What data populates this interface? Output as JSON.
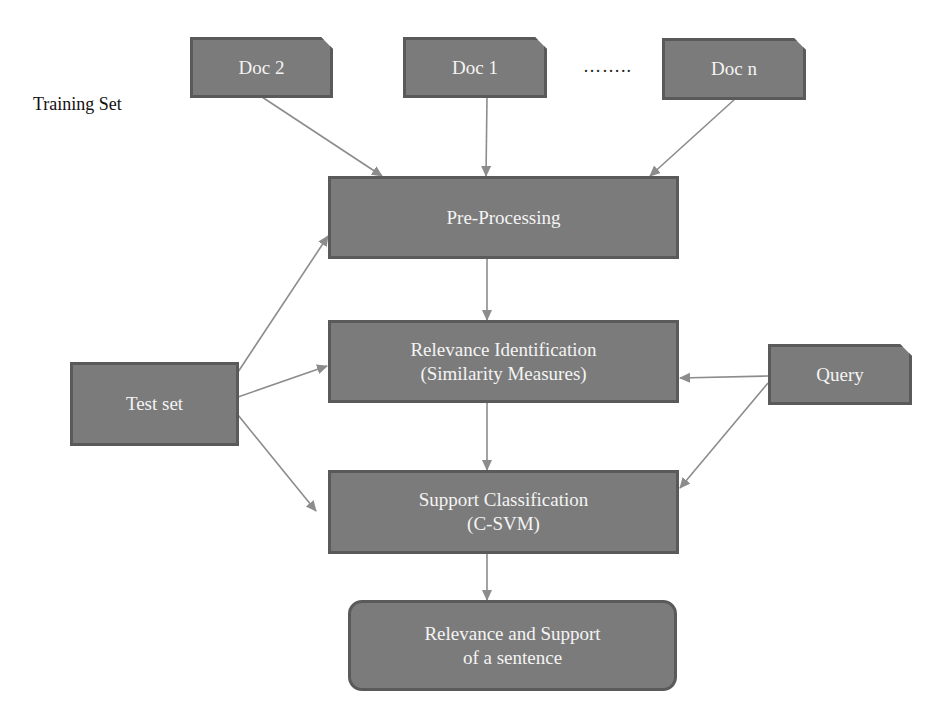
{
  "diagram": {
    "training_set_label": "Training Set",
    "ellipsis": "……..",
    "nodes": {
      "doc2": "Doc 2",
      "doc1": "Doc 1",
      "docn": "Doc n",
      "preprocessing": "Pre-Processing",
      "relevance_line1": "Relevance Identification",
      "relevance_line2": "(Similarity Measures)",
      "testset": "Test set",
      "query": "Query",
      "support_line1": "Support Classification",
      "support_line2": "(C-SVM)",
      "output_line1": "Relevance and Support",
      "output_line2": "of a sentence"
    },
    "edges": [
      {
        "from": "Doc 2",
        "to": "Pre-Processing"
      },
      {
        "from": "Doc 1",
        "to": "Pre-Processing"
      },
      {
        "from": "Doc n",
        "to": "Pre-Processing"
      },
      {
        "from": "Test set",
        "to": "Pre-Processing"
      },
      {
        "from": "Test set",
        "to": "Relevance Identification"
      },
      {
        "from": "Test set",
        "to": "Support Classification"
      },
      {
        "from": "Pre-Processing",
        "to": "Relevance Identification"
      },
      {
        "from": "Query",
        "to": "Relevance Identification"
      },
      {
        "from": "Query",
        "to": "Support Classification"
      },
      {
        "from": "Relevance Identification",
        "to": "Support Classification"
      },
      {
        "from": "Support Classification",
        "to": "Relevance and Support of a sentence"
      }
    ],
    "colors": {
      "node_fill": "#7b7b7b",
      "node_border": "#5a5a5a",
      "edge": "#8c8c8c",
      "text": "#f4f4f4"
    }
  }
}
